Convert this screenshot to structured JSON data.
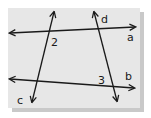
{
  "diagram": {
    "card": {
      "x": 8,
      "y": 8,
      "width": 132,
      "height": 100,
      "fill": "#e7e7e7",
      "shadow": "#bdbdbd"
    },
    "stroke_color": "#1a1a1a",
    "lines": [
      {
        "name": "a",
        "x1": 10,
        "y1": 33,
        "x2": 135,
        "y2": 27
      },
      {
        "name": "b",
        "x1": 10,
        "y1": 79,
        "x2": 134,
        "y2": 88
      },
      {
        "name": "c",
        "x1": 54,
        "y1": 12,
        "x2": 32,
        "y2": 102
      },
      {
        "name": "d",
        "x1": 94,
        "y1": 12,
        "x2": 117,
        "y2": 101
      }
    ],
    "labels": {
      "line_a": {
        "text": "a",
        "x": 127,
        "y": 41
      },
      "line_b": {
        "text": "b",
        "x": 125,
        "y": 80
      },
      "line_c": {
        "text": "c",
        "x": 17,
        "y": 104
      },
      "line_d": {
        "text": "d",
        "x": 101,
        "y": 23
      },
      "angle_2": {
        "text": "2",
        "x": 51,
        "y": 46
      },
      "angle_3": {
        "text": "3",
        "x": 98,
        "y": 84
      }
    }
  }
}
